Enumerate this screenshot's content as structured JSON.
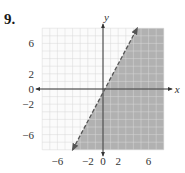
{
  "problem": {
    "number": "9."
  },
  "chart_data": {
    "type": "inequality-graph",
    "title": "",
    "xlabel": "x",
    "ylabel": "y",
    "xlim": [
      -8,
      8
    ],
    "ylim": [
      -8,
      8
    ],
    "grid": true,
    "x_ticks": [
      {
        "value": -6,
        "label": "−6"
      },
      {
        "value": -2,
        "label": "−2"
      },
      {
        "value": 0,
        "label": "0"
      },
      {
        "value": 2,
        "label": "2"
      },
      {
        "value": 6,
        "label": "6"
      }
    ],
    "y_ticks": [
      {
        "value": 6,
        "label": "6"
      },
      {
        "value": 2,
        "label": "2"
      },
      {
        "value": 0,
        "label": "0"
      },
      {
        "value": -2,
        "label": "−2"
      },
      {
        "value": -6,
        "label": "−6"
      }
    ],
    "boundary_line": {
      "equation": "y = 2x - 1",
      "slope": 2,
      "intercept": -1,
      "style": "dashed",
      "from": [
        -4,
        -8
      ],
      "to": [
        4.5,
        8
      ]
    },
    "shaded_region": "y < 2x - 1",
    "colors": {
      "shade": "#a9a9a9",
      "grid": "#d9d9d9",
      "axis": "#333333",
      "line": "#555555"
    }
  }
}
